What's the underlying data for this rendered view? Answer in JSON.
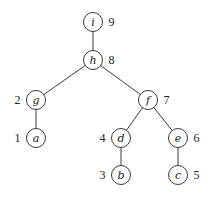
{
  "diagram": {
    "type": "tree",
    "node_radius": 9.5,
    "nodes": [
      {
        "id": "i",
        "label": "i",
        "order": "9",
        "x": 93,
        "y": 22,
        "order_side": "right"
      },
      {
        "id": "h",
        "label": "h",
        "order": "8",
        "x": 93,
        "y": 60,
        "order_side": "right"
      },
      {
        "id": "g",
        "label": "g",
        "order": "2",
        "x": 36,
        "y": 100,
        "order_side": "left"
      },
      {
        "id": "a",
        "label": "a",
        "order": "1",
        "x": 36,
        "y": 138,
        "order_side": "left"
      },
      {
        "id": "f",
        "label": "f",
        "order": "7",
        "x": 148,
        "y": 100,
        "order_side": "right"
      },
      {
        "id": "d",
        "label": "d",
        "order": "4",
        "x": 121,
        "y": 138,
        "order_side": "left"
      },
      {
        "id": "b",
        "label": "b",
        "order": "3",
        "x": 121,
        "y": 175,
        "order_side": "left"
      },
      {
        "id": "e",
        "label": "e",
        "order": "6",
        "x": 178,
        "y": 138,
        "order_side": "right"
      },
      {
        "id": "c",
        "label": "c",
        "order": "5",
        "x": 178,
        "y": 175,
        "order_side": "right"
      }
    ],
    "edges": [
      {
        "from": "i",
        "to": "h"
      },
      {
        "from": "h",
        "to": "g"
      },
      {
        "from": "h",
        "to": "f"
      },
      {
        "from": "g",
        "to": "a"
      },
      {
        "from": "f",
        "to": "d"
      },
      {
        "from": "f",
        "to": "e"
      },
      {
        "from": "d",
        "to": "b"
      },
      {
        "from": "e",
        "to": "c"
      }
    ]
  }
}
